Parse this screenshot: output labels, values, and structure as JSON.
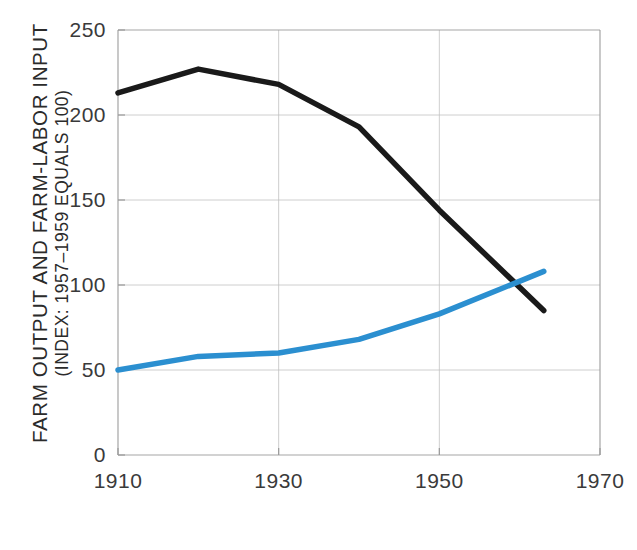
{
  "chart_data": {
    "type": "line",
    "title": "",
    "subtitle": "",
    "xlabel": "",
    "ylabel_line1": "FARM OUTPUT AND FARM-LABOR INPUT",
    "ylabel_line2": "(INDEX: 1957–1959 EQUALS 100)",
    "xlim": [
      1910,
      1970
    ],
    "ylim": [
      0,
      250
    ],
    "xticks": [
      "1910",
      "1930",
      "1950",
      "1970"
    ],
    "xtick_values": [
      1910,
      1930,
      1950,
      1970
    ],
    "yticks": [
      "0",
      "50",
      "100",
      "150",
      "200",
      "250"
    ],
    "ytick_values": [
      0,
      50,
      100,
      150,
      200,
      250
    ],
    "grid": true,
    "grid_color": "#bdbdbd",
    "legend": "none",
    "legend_position": "none",
    "x": [
      1910,
      1920,
      1930,
      1940,
      1950,
      1963
    ],
    "series": [
      {
        "name": "Farm-labor input",
        "color": "#1a1a1a",
        "values": [
          213,
          227,
          218,
          193,
          144,
          85
        ]
      },
      {
        "name": "Farm output",
        "color": "#2b8fd0",
        "values": [
          50,
          58,
          60,
          68,
          83,
          108
        ]
      }
    ],
    "annotations": []
  },
  "axis": {
    "frame_color": "#9a9a9a"
  }
}
